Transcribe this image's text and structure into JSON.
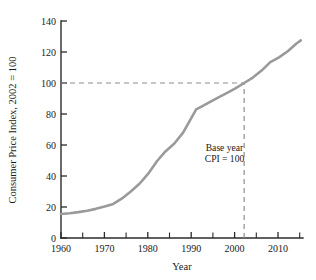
{
  "chart_data": {
    "type": "line",
    "title": "",
    "xlabel": "Year",
    "ylabel": "Consumer Price Index, 2002 = 100",
    "xlim": [
      1960,
      2015.5
    ],
    "ylim": [
      0,
      140
    ],
    "grid": false,
    "legend": null,
    "line_color": "#9a9a9a",
    "axis_color": "#2b2b2b",
    "guide_color": "#8e8e8e",
    "x_ticks_major": [
      1960,
      1970,
      1980,
      1990,
      2000,
      2010
    ],
    "x_ticks_major_labels": [
      "1960",
      "1970",
      "1980",
      "1990",
      "2000",
      "2010"
    ],
    "x_ticks_minor": [
      1965,
      1975,
      1985,
      1995,
      2005,
      2015
    ],
    "y_ticks": [
      0,
      20,
      40,
      60,
      80,
      100,
      120,
      140
    ],
    "y_tick_labels": [
      "0",
      "20",
      "40",
      "60",
      "80",
      "100",
      "120",
      "140"
    ],
    "series": [
      {
        "name": "Consumer Price Index",
        "x": [
          1960,
          1962,
          1964,
          1966,
          1968,
          1970,
          1972,
          1974,
          1976,
          1978,
          1980,
          1982,
          1984,
          1986,
          1988,
          1990,
          1991,
          1992,
          1994,
          1996,
          1998,
          2000,
          2002,
          2004,
          2006,
          2008,
          2010,
          2012,
          2014,
          2015
        ],
        "values": [
          15.5,
          16.0,
          16.7,
          17.6,
          18.8,
          20.3,
          22.0,
          25.5,
          30.0,
          35.0,
          41.5,
          49.5,
          56.0,
          61.0,
          68.0,
          78.0,
          83.0,
          84.5,
          87.5,
          90.5,
          93.5,
          96.5,
          100.0,
          103.5,
          108.0,
          113.5,
          116.5,
          120.5,
          125.5,
          127.5
        ]
      }
    ],
    "annotations": [
      {
        "name": "base-year-note",
        "lines": [
          "Base year",
          "CPI = 100"
        ],
        "x": 1997.5,
        "y": 56
      }
    ],
    "reference_lines": [
      {
        "name": "cpi-100-horizontal",
        "orientation": "horizontal",
        "value": 100,
        "from": 1960,
        "to": 2002,
        "style": "dashed"
      },
      {
        "name": "base-year-2002-vertical",
        "orientation": "vertical",
        "value": 2002,
        "from": 0,
        "to": 100,
        "style": "dashed"
      }
    ]
  }
}
